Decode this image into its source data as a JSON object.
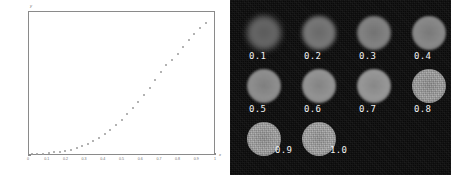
{
  "chart_data": [
    {
      "type": "scatter",
      "title": "",
      "xlabel": "x",
      "ylabel": "y",
      "xlim": [
        0,
        1
      ],
      "ylim": [
        0,
        500
      ],
      "grid": false,
      "legend": null,
      "x_ticks": [
        "0",
        "0.1",
        "0.2",
        "0.3",
        "0.4",
        "0.5",
        "0.6",
        "0.7",
        "0.8",
        "0.9",
        "1"
      ],
      "x_tick_values": [
        0,
        0.1,
        0.2,
        0.3,
        0.4,
        0.5,
        0.6,
        0.7,
        0.8,
        0.9,
        1
      ],
      "y_ticks": [
        "500",
        "450",
        "400",
        "350",
        "300",
        "250",
        "200",
        "150",
        "100",
        "50",
        "0"
      ],
      "y_tick_values": [
        500,
        450,
        400,
        350,
        300,
        250,
        200,
        150,
        100,
        50,
        0
      ],
      "x": [
        0.02,
        0.05,
        0.08,
        0.11,
        0.14,
        0.17,
        0.2,
        0.23,
        0.26,
        0.29,
        0.32,
        0.35,
        0.38,
        0.41,
        0.44,
        0.47,
        0.5,
        0.53,
        0.56,
        0.59,
        0.62,
        0.65,
        0.68,
        0.71,
        0.74,
        0.77,
        0.8,
        0.83,
        0.86,
        0.89,
        0.92,
        0.95
      ],
      "values": [
        2,
        3,
        5,
        7,
        9,
        12,
        15,
        19,
        24,
        30,
        38,
        48,
        60,
        73,
        88,
        104,
        122,
        141,
        162,
        184,
        208,
        233,
        260,
        288,
        312,
        330,
        352,
        375,
        398,
        420,
        441,
        460
      ]
    },
    {
      "type": "heatmap",
      "title": "",
      "description": "grid of circular phantom images labeled by parameter value",
      "columns": 4,
      "rows": 3,
      "cells": [
        {
          "label": "0.1",
          "brightness": 0.3,
          "blur": 3.2,
          "size": 34,
          "label_pos": "below"
        },
        {
          "label": "0.2",
          "brightness": 0.42,
          "blur": 2.2,
          "size": 34,
          "label_pos": "below"
        },
        {
          "label": "0.3",
          "brightness": 0.5,
          "blur": 1.5,
          "size": 34,
          "label_pos": "below"
        },
        {
          "label": "0.4",
          "brightness": 0.55,
          "blur": 1.2,
          "size": 34,
          "label_pos": "below"
        },
        {
          "label": "0.5",
          "brightness": 0.6,
          "blur": 1.0,
          "size": 34,
          "label_pos": "below"
        },
        {
          "label": "0.6",
          "brightness": 0.64,
          "blur": 0.9,
          "size": 34,
          "label_pos": "below"
        },
        {
          "label": "0.7",
          "brightness": 0.67,
          "blur": 0.8,
          "size": 34,
          "label_pos": "below"
        },
        {
          "label": "0.8",
          "brightness": 0.7,
          "blur": 0.7,
          "size": 34,
          "label_pos": "below"
        },
        {
          "label": "0.9",
          "brightness": 0.72,
          "blur": 0.7,
          "size": 34,
          "label_pos": "right"
        },
        {
          "label": "1.0",
          "brightness": 0.74,
          "blur": 0.6,
          "size": 34,
          "label_pos": "right"
        }
      ]
    }
  ],
  "colors": {
    "plot_background": "#ffffff",
    "plot_axis": "#8a8a8a",
    "plot_tick_text": "#6f6f6f",
    "plot_point": "#9a9a9a",
    "image_background": "#0a0a0a",
    "image_label_text": "#f2f2f2"
  }
}
